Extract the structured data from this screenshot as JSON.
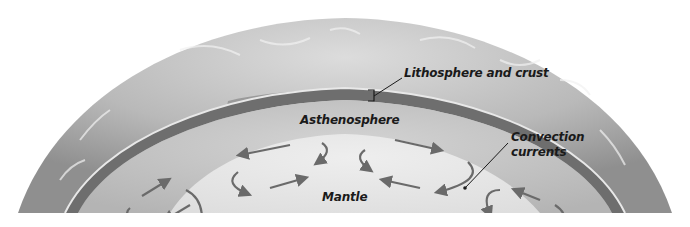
{
  "diagram": {
    "layers": [
      {
        "id": "atmosphere",
        "label": ""
      },
      {
        "id": "lithosphere",
        "label": "Lithosphere and crust"
      },
      {
        "id": "asthenosphere",
        "label": "Asthenosphere"
      },
      {
        "id": "mantle",
        "label": "Mantle"
      }
    ],
    "labels": {
      "lithosphere": "Lithosphere and crust",
      "asthenosphere": "Asthenosphere",
      "convection_line1": "Convection",
      "convection_line2": "currents",
      "mantle": "Mantle"
    },
    "colors": {
      "background": "#ffffff",
      "atmosphere_light": "#d6d6d6",
      "atmosphere_dark": "#8a8a8a",
      "lithosphere_band": "#6e6e6e",
      "crust_gap": "#c8c8c8",
      "asthenosphere": "#bdbdbd",
      "mantle": "#e6e6e6",
      "arrow": "#6a6a6a",
      "label_text": "#1a1a1a"
    }
  }
}
